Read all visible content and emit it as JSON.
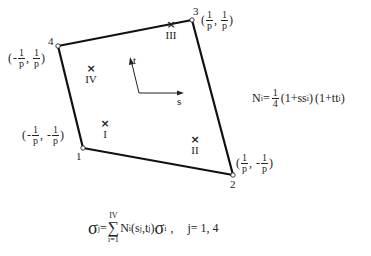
{
  "diagram": {
    "nodes": [
      {
        "id": "1",
        "x": 83,
        "y": 148,
        "coord": {
          "s_sign": "-",
          "t_sign": "-",
          "num": "1",
          "den": "p"
        }
      },
      {
        "id": "2",
        "x": 233,
        "y": 175,
        "coord": {
          "s_sign": "",
          "t_sign": "-",
          "num": "1",
          "den": "p"
        }
      },
      {
        "id": "3",
        "x": 192,
        "y": 20,
        "coord": {
          "s_sign": "",
          "t_sign": "",
          "num": "1",
          "den": "p"
        }
      },
      {
        "id": "4",
        "x": 58,
        "y": 46,
        "coord": {
          "s_sign": "-",
          "t_sign": "",
          "num": "1",
          "den": "p"
        }
      }
    ],
    "gauss_points": [
      {
        "label": "I",
        "x": 105,
        "y": 125
      },
      {
        "label": "II",
        "x": 195,
        "y": 141
      },
      {
        "label": "III",
        "x": 171,
        "y": 26
      },
      {
        "label": "IV",
        "x": 91,
        "y": 70
      }
    ],
    "axes": {
      "s_label": "s",
      "t_label": "t"
    },
    "marker": "×",
    "shape_function": {
      "lhs": "N",
      "lhs_sub": "i",
      "eq": "=",
      "coef_num": "1",
      "coef_den": "4",
      "term1": "(1+ss",
      "term1_sub": "i",
      "term1_close": ")",
      "term2": "(1+tt",
      "term2_sub": "i",
      "term2_close": ")"
    },
    "extrapolation": {
      "sigma": "σ",
      "lhs_sub": "j",
      "eq": "=",
      "sum_top": "IV",
      "sum_bottom": "i=1",
      "sum": "∑",
      "n": "N",
      "n_sub": "i",
      "args_open": "(s",
      "s_sub": "j",
      "comma": ",t",
      "t_sub": "j",
      "args_close": ")",
      "rhs_sub": "i",
      "trail": ",",
      "range": "j= 1, 4"
    },
    "colors": {
      "line": "#111111",
      "text": "#222222"
    }
  }
}
